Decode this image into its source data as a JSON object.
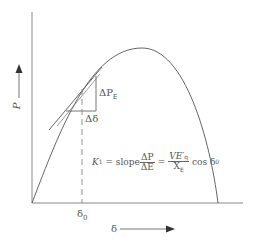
{
  "diagram": {
    "type": "power-angle curve",
    "y_axis_label": "P",
    "x_axis_label": "δ",
    "tick_label": "δ",
    "tick_sub": "0",
    "delta_p_label": "ΔP",
    "delta_p_sub": "E",
    "delta_delta_label": "Δδ",
    "formula": {
      "lhs": "K",
      "lhs_sub": "1",
      "equals1": " = slope",
      "frac1_num": "ΔP",
      "frac1_den": "ΔE",
      "equals2": " = ",
      "frac2_num": "VE′",
      "frac2_num_sub": "q",
      "frac2_den": "X",
      "frac2_den_sub": "E",
      "tail": " cos δ",
      "tail_sub": "0"
    },
    "colors": {
      "line": "#666666",
      "axis": "#888888"
    }
  }
}
